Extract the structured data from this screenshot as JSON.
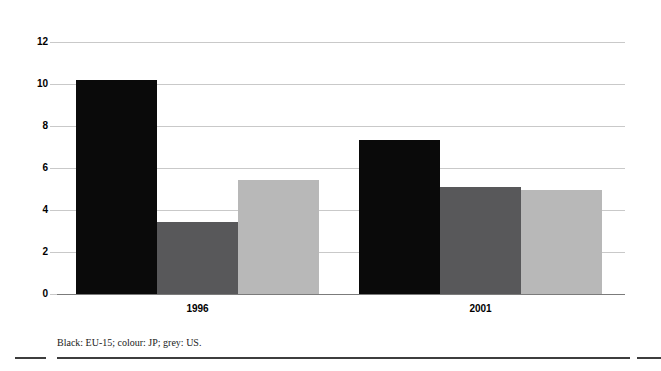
{
  "chart_data": {
    "type": "bar",
    "title": "",
    "subtitle": "",
    "xlabel": "",
    "ylabel": "",
    "categories": [
      "1996",
      "2001"
    ],
    "ylim": [
      0,
      12
    ],
    "yticks": [
      0,
      2,
      4,
      6,
      8,
      10,
      12
    ],
    "ytick_labels": [
      "0",
      "2",
      "4",
      "6",
      "8",
      "10",
      "12"
    ],
    "grid": true,
    "legend_position": "none",
    "series": [
      {
        "name": "EU-15",
        "color": "#0a0a0a",
        "swatch": "Black",
        "values": [
          10.2,
          7.35
        ]
      },
      {
        "name": "JP",
        "color": "#58585a",
        "swatch": "colour",
        "values": [
          3.45,
          5.1
        ]
      },
      {
        "name": "US",
        "color": "#b8b8b8",
        "swatch": "grey",
        "values": [
          5.45,
          4.95
        ]
      }
    ],
    "annotations": [
      "Black: EU-15; colour: JP; grey: US."
    ]
  },
  "footnote": {
    "text": "Black: EU-15; colour: JP; grey: US."
  },
  "colors": {
    "series_black": "#0a0a0a",
    "series_dark_grey": "#58585a",
    "series_light_grey": "#b8b8b8",
    "gridline": "#c9c9c9",
    "axis": "#7b7b7b",
    "rule": "#3d3d3d",
    "background": "#ffffff"
  }
}
